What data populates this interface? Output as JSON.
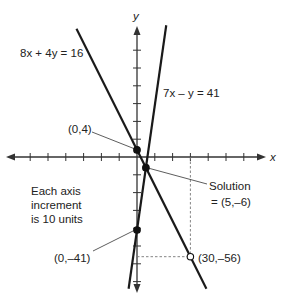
{
  "axes": {
    "x_label": "x",
    "y_label": "y",
    "tick_increment": 10,
    "x_range": [
      -75,
      75
    ],
    "y_range": [
      -75,
      75
    ]
  },
  "lines": [
    {
      "name": "line-8x-4y-16",
      "equation": "8x + 4y = 16",
      "slope": -2,
      "intercept": 4
    },
    {
      "name": "line-7x-y-41",
      "equation": "7x – y = 41",
      "slope": 7,
      "intercept": -41
    }
  ],
  "points": [
    {
      "name": "point-0-4",
      "label": "(0,4)",
      "x": 0,
      "y": 4,
      "filled": true
    },
    {
      "name": "point-solution",
      "label": "Solution",
      "label2": "= (5,–6)",
      "x": 5,
      "y": -6,
      "filled": true
    },
    {
      "name": "point-0-neg41",
      "label": "(0,–41)",
      "x": 0,
      "y": -41,
      "filled": true
    },
    {
      "name": "point-30-neg56",
      "label": "(30,–56)",
      "x": 30,
      "y": -56,
      "filled": false
    }
  ],
  "note": {
    "line1": "Each axis",
    "line2": "increment",
    "line3": "is 10 units"
  },
  "colors": {
    "ink": "#1a1a1a",
    "axis": "#333333",
    "dash": "#777777"
  }
}
